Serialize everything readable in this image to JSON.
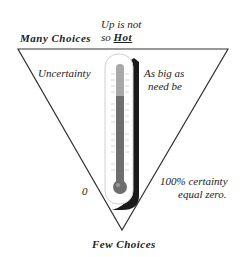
{
  "diagram": {
    "top_left_label": "Many Choices",
    "top_note_line1": "Up is not",
    "top_note_line2_prefix": "so",
    "top_note_line2_emph": "Hot",
    "left_label": "Uncertainty",
    "right_label_line1": "As big as",
    "right_label_line2": "need be",
    "zero_label": "0",
    "bottom_right_line1": "100% certainty",
    "bottom_right_line2": "equal zero.",
    "bottom_label": "Few Choices",
    "colors": {
      "line": "#333333",
      "mercury_upper": "#a8a8a8",
      "mercury_lower": "#6e6e6e",
      "shadow": "#1a1a1a",
      "tube_outline": "#cfcfcf"
    }
  }
}
